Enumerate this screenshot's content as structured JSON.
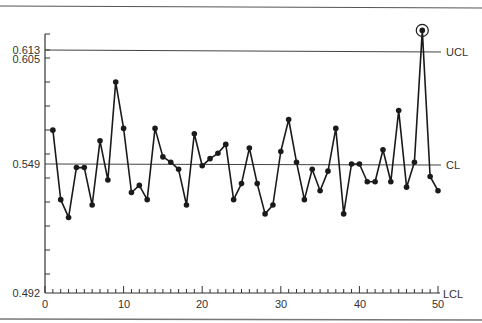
{
  "chart_data": {
    "type": "line",
    "title": "",
    "xlabel": "",
    "ylabel": "",
    "xlim": [
      0,
      50
    ],
    "ylim_labels": [
      "0.492",
      "0.549",
      "0.605",
      "0.613"
    ],
    "x_ticks": [
      0,
      10,
      20,
      30,
      40,
      50
    ],
    "x_tick_labels": [
      "0",
      "10",
      "20",
      "30",
      "40",
      "50"
    ],
    "y_tick_labels": [
      "0.613",
      "0.605",
      "0.549",
      "0.492"
    ],
    "control_lines": [
      {
        "name": "UCL",
        "value": 0.613
      },
      {
        "name": "CL",
        "value": 0.549
      },
      {
        "name": "LCL",
        "value": 0.492
      }
    ],
    "grid": false,
    "legend": "none",
    "annotations": [
      {
        "type": "circled-point",
        "x": 48,
        "note": "out of control point above UCL"
      }
    ],
    "series": [
      {
        "name": "sample",
        "x": [
          1,
          2,
          3,
          4,
          5,
          6,
          7,
          8,
          9,
          10,
          11,
          12,
          13,
          14,
          15,
          16,
          17,
          18,
          19,
          20,
          21,
          22,
          23,
          24,
          25,
          26,
          27,
          28,
          29,
          30,
          31,
          32,
          33,
          34,
          35,
          36,
          37,
          38,
          39,
          40,
          41,
          42,
          43,
          44,
          45,
          46,
          47,
          48,
          49,
          50
        ],
        "values": [
          0.568,
          0.529,
          0.519,
          0.547,
          0.547,
          0.526,
          0.562,
          0.54,
          0.595,
          0.569,
          0.533,
          0.537,
          0.529,
          0.569,
          0.553,
          0.55,
          0.546,
          0.526,
          0.566,
          0.548,
          0.552,
          0.555,
          0.56,
          0.529,
          0.538,
          0.558,
          0.538,
          0.521,
          0.526,
          0.556,
          0.574,
          0.55,
          0.529,
          0.546,
          0.534,
          0.545,
          0.569,
          0.521,
          0.549,
          0.549,
          0.539,
          0.539,
          0.557,
          0.539,
          0.579,
          0.536,
          0.55,
          0.624,
          0.542,
          0.534
        ]
      }
    ]
  },
  "labels": {
    "ucl": "UCL",
    "cl": "CL",
    "lcl": "LCL",
    "y_0613": "0.613",
    "y_0605": "0.605",
    "y_0549": "0.549",
    "y_0492": "0.492",
    "x_0": "0",
    "x_10": "10",
    "x_20": "20",
    "x_30": "30",
    "x_40": "40",
    "x_50": "50"
  }
}
